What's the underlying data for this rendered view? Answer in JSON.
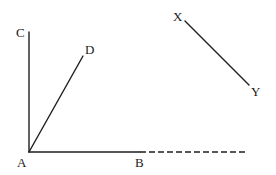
{
  "diagram": {
    "points": {
      "A": "A",
      "B": "B",
      "C": "C",
      "D": "D",
      "X": "X",
      "Y": "Y"
    },
    "segments": [
      {
        "from": "A",
        "to": "C",
        "style": "solid"
      },
      {
        "from": "A",
        "to": "D",
        "style": "solid"
      },
      {
        "from": "A",
        "to": "B",
        "style": "solid"
      },
      {
        "from": "B",
        "to": "beyond",
        "style": "dashed"
      },
      {
        "from": "X",
        "to": "Y",
        "style": "solid"
      }
    ]
  }
}
